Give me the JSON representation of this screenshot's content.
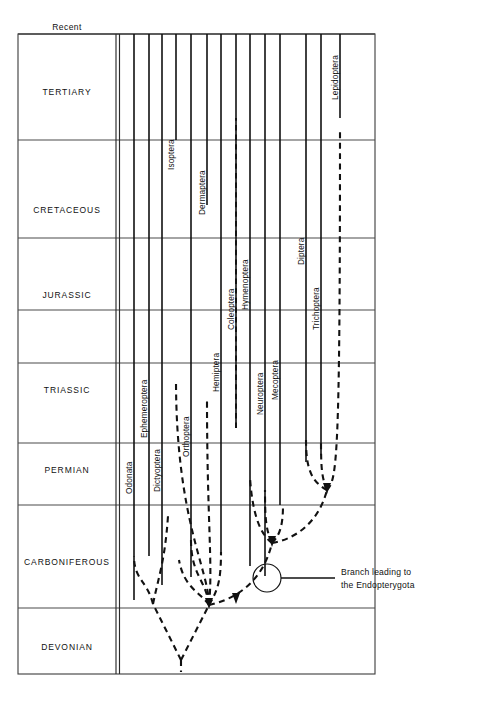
{
  "figure": {
    "background": "#ffffff",
    "line_color": "#111111",
    "rule_color": "#4a4a4a"
  },
  "time_axis": {
    "top_marker": "Recent",
    "periods": [
      {
        "name": "TERTIARY",
        "y_top": 34,
        "y_bottom": 140,
        "label_y": 95
      },
      {
        "name": "CRETACEOUS",
        "y_top": 140,
        "y_bottom": 238,
        "label_y": 213
      },
      {
        "name": "JURASSIC",
        "y_top": 238,
        "y_bottom": 310,
        "label_y": 298
      },
      {
        "name": "TRIASSIC",
        "y_top": 310,
        "y_bottom": 363,
        "label_y": 393
      },
      {
        "name": "PERMIAN",
        "y_top": 363,
        "y_bottom": 443,
        "label_y": 473
      },
      {
        "name": "CARBONIFEROUS",
        "y_top": 443,
        "y_bottom": 505,
        "label_y": 565
      },
      {
        "name": "DEVONIAN",
        "y_top": 505,
        "y_bottom": 608,
        "label_y": 650
      }
    ],
    "rules_y": [
      34,
      140,
      238,
      310,
      363,
      443,
      505,
      608
    ]
  },
  "frame": {
    "left": 18,
    "top": 34,
    "right": 375,
    "bottom": 674
  },
  "axis_double_line": {
    "x1": 116,
    "x2": 119,
    "y_top": 34,
    "y_bottom": 674
  },
  "chart_data": {
    "type": "line",
    "xlabel": "",
    "ylabel": "Geological period",
    "categories": [
      "Odonata",
      "Ephemeroptera",
      "Dictyoptera",
      "Orthoptera",
      "Isoptera",
      "Dermaptera",
      "Hemiptera",
      "Coleoptera",
      "Hymenoptera",
      "Neuroptera",
      "Mecoptera",
      "Diptera",
      "Trichoptera",
      "Lepidoptera"
    ],
    "orders": [
      {
        "name": "Odonata",
        "x": 134,
        "label_y": 494,
        "solid_top": 34,
        "solid_bottom": 600,
        "style": "solid"
      },
      {
        "name": "Ephemeroptera",
        "x": 149,
        "label_y": 438,
        "solid_top": 34,
        "solid_bottom": 556,
        "style": "solid"
      },
      {
        "name": "Dictyoptera",
        "x": 162,
        "label_y": 492,
        "solid_top": 34,
        "solid_bottom": 585,
        "style": "solid"
      },
      {
        "name": "Orthoptera",
        "x": 191,
        "label_y": 457,
        "solid_top": 34,
        "solid_bottom": 577,
        "style": "solid"
      },
      {
        "name": "Isoptera",
        "x": 176,
        "label_y": 170,
        "solid_top": 34,
        "solid_bottom": 140,
        "style": "dashed-below"
      },
      {
        "name": "Dermaptera",
        "x": 207,
        "label_y": 215,
        "solid_top": 34,
        "solid_bottom": 205,
        "style": "dashed-below"
      },
      {
        "name": "Hemiptera",
        "x": 221,
        "label_y": 392,
        "solid_top": 34,
        "solid_bottom": 555,
        "style": "solid"
      },
      {
        "name": "Coleoptera",
        "x": 236,
        "label_y": 330,
        "solid_top": 34,
        "solid_bottom": 428,
        "style": "dashed-below"
      },
      {
        "name": "Hymenoptera",
        "x": 250,
        "label_y": 310,
        "solid_top": 34,
        "solid_bottom": 566,
        "style": "solid"
      },
      {
        "name": "Neuroptera",
        "x": 265,
        "label_y": 415,
        "solid_top": 34,
        "solid_bottom": 576,
        "style": "solid"
      },
      {
        "name": "Mecoptera",
        "x": 280,
        "label_y": 400,
        "solid_top": 34,
        "solid_bottom": 505,
        "style": "solid"
      },
      {
        "name": "Diptera",
        "x": 306,
        "label_y": 265,
        "solid_top": 34,
        "solid_bottom": 462,
        "style": "dashed-below"
      },
      {
        "name": "Trichoptera",
        "x": 321,
        "label_y": 330,
        "solid_top": 34,
        "solid_bottom": 455,
        "style": "solid"
      },
      {
        "name": "Lepidoptera",
        "x": 340,
        "label_y": 100,
        "solid_top": 34,
        "solid_bottom": 118,
        "style": "dashed-below"
      }
    ],
    "nodes": [
      {
        "name": "root",
        "x": 181,
        "y": 660
      },
      {
        "name": "palaeoptera-node",
        "x": 153,
        "y": 603
      },
      {
        "name": "neoptera-node",
        "x": 209,
        "y": 604
      },
      {
        "name": "endopterygota",
        "x": 272,
        "y": 543
      },
      {
        "name": "panorpoid-node",
        "x": 327,
        "y": 490
      }
    ],
    "annotation": {
      "line1": "Branch leading to",
      "line2": "the Endopterygota",
      "circle": {
        "cx": 267,
        "cy": 578,
        "r": 14
      },
      "leader_x1": 281,
      "leader_x2": 335,
      "leader_y": 578,
      "text_x": 341,
      "text_y1": 575,
      "text_y2": 588
    },
    "grid": true,
    "legend": "none"
  }
}
